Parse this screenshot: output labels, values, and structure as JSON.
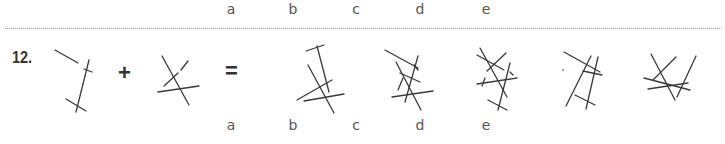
{
  "question": {
    "number": "12.",
    "plus": "+",
    "equals": "=",
    "operand_1_icon": "line-figure-1-icon",
    "operand_2_icon": "line-figure-2-icon"
  },
  "options_top": [
    "a",
    "b",
    "c",
    "d",
    "e"
  ],
  "options_bottom": [
    "a",
    "b",
    "c",
    "d",
    "e"
  ],
  "option_icons": [
    "option-a-figure-icon",
    "option-b-figure-icon",
    "option-c-figure-icon",
    "option-d-figure-icon",
    "option-e-figure-icon"
  ],
  "colors": {
    "line": "#3a3a3a",
    "text": "#333333",
    "divider": "#9a9a9a"
  }
}
